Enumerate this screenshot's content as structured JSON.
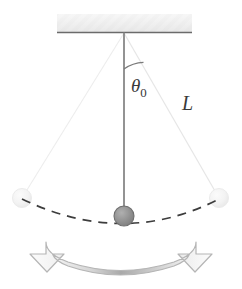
{
  "diagram": {
    "background_color": "#ffffff",
    "width": 242,
    "height": 289,
    "labels": {
      "angle_symbol": "θ",
      "angle_subscript": "0",
      "length_symbol": "L"
    },
    "colors": {
      "string_main": "#808080",
      "string_faint": "#ededed",
      "bob_fill": "#8f8f8f",
      "bob_stroke": "#6e6e6e",
      "bob_faint_fill": "#f2f2f2",
      "bob_faint_stroke": "#e4e4e4",
      "ceiling_fill": "#efefef",
      "ceiling_edge": "#6b6b6b",
      "dashed_arc": "#3d3d3d",
      "arrow_outline": "#b5b5b5",
      "arrow_fill_center": "#a8a8a8",
      "arrow_fill_edge": "#fafafa",
      "label_color": "#3a3a3a",
      "arc_color": "#7a7a7a"
    },
    "geometry": {
      "pivot_x": 124,
      "pivot_y": 33,
      "string_length": 183,
      "amplitude_degrees": 32,
      "bob_radius": 10,
      "ceiling_left": 57,
      "ceiling_right": 192,
      "ceiling_top": 14,
      "ceiling_bottom": 33,
      "bob_center_x": 124,
      "bob_center_y": 216,
      "left_bob_x": 22,
      "left_bob_y": 198,
      "right_bob_x": 219,
      "right_bob_y": 198,
      "angle_arc_radius": 36,
      "angle_label_x": 131,
      "angle_label_y": 92,
      "length_label_x": 182,
      "length_label_y": 110
    },
    "elements": {
      "ceiling_name": "ceiling-support",
      "pivot_name": "pivot-point",
      "main_string_name": "pendulum-string-equilibrium",
      "left_string_name": "pendulum-string-left-extreme",
      "right_string_name": "pendulum-string-right-extreme",
      "bob_name": "pendulum-bob",
      "left_bob_name": "pendulum-bob-left-ghost",
      "right_bob_name": "pendulum-bob-right-ghost",
      "arc_name": "swing-path-dashed-arc",
      "angle_arc_name": "amplitude-angle-arc",
      "arrow_name": "oscillation-direction-arrow"
    }
  }
}
